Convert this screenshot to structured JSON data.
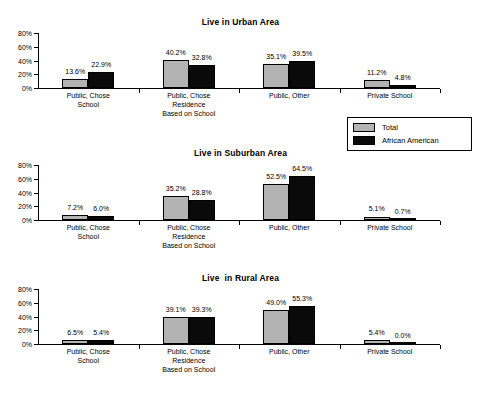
{
  "legend": {
    "entries": [
      {
        "label": "Total",
        "color": "#b3b3b3",
        "key": "total"
      },
      {
        "label": "African American",
        "color": "#0a0a0a",
        "key": "aa"
      }
    ]
  },
  "axis": {
    "tick_labels": [
      "0%",
      "20%",
      "40%",
      "60%",
      "80%"
    ]
  },
  "categories": [
    "Public, Chose\nSchool",
    "Public, Chose\nResidence\nBased on School",
    "Public, Other",
    "Private School"
  ],
  "charts": [
    {
      "id": "urban",
      "title": "Live in Urban Area",
      "labels": {
        "total": [
          "13.6%",
          "40.2%",
          "35.1%",
          "11.2%"
        ],
        "aa": [
          "22.9%",
          "32.8%",
          "39.5%",
          "4.8%"
        ]
      }
    },
    {
      "id": "suburban",
      "title": "Live in Suburban Area",
      "labels": {
        "total": [
          "7.2%",
          "35.2%",
          "52.5%",
          "5.1%"
        ],
        "aa": [
          "6.0%",
          "28.8%",
          "64.5%",
          "0.7%"
        ]
      }
    },
    {
      "id": "rural",
      "title": "Live  in Rural Area",
      "labels": {
        "total": [
          "6.5%",
          "39.1%",
          "49.0%",
          "5.4%"
        ],
        "aa": [
          "5.4%",
          "39.3%",
          "55.3%",
          "0.0%"
        ]
      }
    }
  ],
  "chart_data": [
    {
      "type": "bar",
      "title": "Live in Urban Area",
      "xlabel": "",
      "ylabel": "",
      "ylim": [
        0,
        80
      ],
      "yticks": [
        0,
        20,
        40,
        60,
        80
      ],
      "ytick_labels": [
        "0%",
        "20%",
        "40%",
        "60%",
        "80%"
      ],
      "grid": false,
      "legend_position": "right-outside",
      "categories": [
        "Public, Chose School",
        "Public, Chose Residence Based on School",
        "Public, Other",
        "Private School"
      ],
      "series": [
        {
          "name": "Total",
          "color": "#b3b3b3",
          "values": [
            13.6,
            40.2,
            35.1,
            11.2
          ]
        },
        {
          "name": "African American",
          "color": "#0a0a0a",
          "values": [
            22.9,
            32.8,
            39.5,
            4.8
          ]
        }
      ]
    },
    {
      "type": "bar",
      "title": "Live in Suburban Area",
      "xlabel": "",
      "ylabel": "",
      "ylim": [
        0,
        80
      ],
      "yticks": [
        0,
        20,
        40,
        60,
        80
      ],
      "ytick_labels": [
        "0%",
        "20%",
        "40%",
        "60%",
        "80%"
      ],
      "grid": false,
      "legend_position": "right-outside",
      "categories": [
        "Public, Chose School",
        "Public, Chose Residence Based on School",
        "Public, Other",
        "Private School"
      ],
      "series": [
        {
          "name": "Total",
          "color": "#b3b3b3",
          "values": [
            7.2,
            35.2,
            52.5,
            5.1
          ]
        },
        {
          "name": "African American",
          "color": "#0a0a0a",
          "values": [
            6.0,
            28.8,
            64.5,
            0.7
          ]
        }
      ]
    },
    {
      "type": "bar",
      "title": "Live  in Rural Area",
      "xlabel": "",
      "ylabel": "",
      "ylim": [
        0,
        80
      ],
      "yticks": [
        0,
        20,
        40,
        60,
        80
      ],
      "ytick_labels": [
        "0%",
        "20%",
        "40%",
        "60%",
        "80%"
      ],
      "grid": false,
      "legend_position": "right-outside",
      "categories": [
        "Public, Chose School",
        "Public, Chose Residence Based on School",
        "Public, Other",
        "Private School"
      ],
      "series": [
        {
          "name": "Total",
          "color": "#b3b3b3",
          "values": [
            6.5,
            39.1,
            49.0,
            5.4
          ]
        },
        {
          "name": "African American",
          "color": "#0a0a0a",
          "values": [
            5.4,
            39.3,
            55.3,
            0.0
          ]
        }
      ]
    }
  ]
}
